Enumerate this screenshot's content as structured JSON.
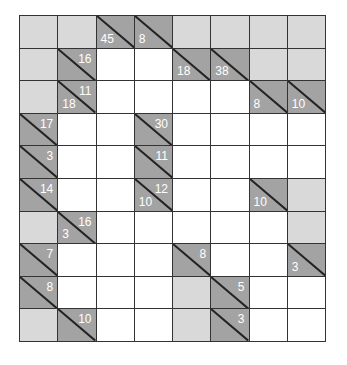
{
  "puzzle": {
    "type": "kakuro",
    "rows": 10,
    "cols": 8,
    "colors": {
      "blocked": "#d9d9d9",
      "clue": "#a3a3a3",
      "empty": "#ffffff",
      "grid_line": "#333333",
      "clue_text": "#ffffff"
    },
    "cells": [
      [
        {
          "t": "L"
        },
        {
          "t": "L"
        },
        {
          "t": "D",
          "down": "45"
        },
        {
          "t": "D",
          "down": "8"
        },
        {
          "t": "L"
        },
        {
          "t": "L"
        },
        {
          "t": "L"
        },
        {
          "t": "L"
        }
      ],
      [
        {
          "t": "L"
        },
        {
          "t": "D",
          "right": "16"
        },
        {
          "t": "W"
        },
        {
          "t": "W"
        },
        {
          "t": "D",
          "down": "18"
        },
        {
          "t": "D",
          "down": "38"
        },
        {
          "t": "L"
        },
        {
          "t": "L"
        }
      ],
      [
        {
          "t": "L"
        },
        {
          "t": "D",
          "down": "18",
          "right": "11"
        },
        {
          "t": "W"
        },
        {
          "t": "W"
        },
        {
          "t": "W"
        },
        {
          "t": "W"
        },
        {
          "t": "D",
          "down": "8"
        },
        {
          "t": "D",
          "down": "10"
        }
      ],
      [
        {
          "t": "D",
          "right": "17"
        },
        {
          "t": "W"
        },
        {
          "t": "W"
        },
        {
          "t": "D",
          "right": "30"
        },
        {
          "t": "W"
        },
        {
          "t": "W"
        },
        {
          "t": "W"
        },
        {
          "t": "W"
        }
      ],
      [
        {
          "t": "D",
          "right": "3"
        },
        {
          "t": "W"
        },
        {
          "t": "W"
        },
        {
          "t": "D",
          "right": "11"
        },
        {
          "t": "W"
        },
        {
          "t": "W"
        },
        {
          "t": "W"
        },
        {
          "t": "W"
        }
      ],
      [
        {
          "t": "D",
          "right": "14"
        },
        {
          "t": "W"
        },
        {
          "t": "W"
        },
        {
          "t": "D",
          "down": "10",
          "right": "12"
        },
        {
          "t": "W"
        },
        {
          "t": "W"
        },
        {
          "t": "D",
          "down": "10"
        },
        {
          "t": "L"
        }
      ],
      [
        {
          "t": "L"
        },
        {
          "t": "D",
          "down": "3",
          "right": "16"
        },
        {
          "t": "W"
        },
        {
          "t": "W"
        },
        {
          "t": "W"
        },
        {
          "t": "W"
        },
        {
          "t": "W"
        },
        {
          "t": "L"
        }
      ],
      [
        {
          "t": "D",
          "right": "7"
        },
        {
          "t": "W"
        },
        {
          "t": "W"
        },
        {
          "t": "W"
        },
        {
          "t": "D",
          "right": "8"
        },
        {
          "t": "W"
        },
        {
          "t": "W"
        },
        {
          "t": "D",
          "down": "3"
        }
      ],
      [
        {
          "t": "D",
          "right": "8"
        },
        {
          "t": "W"
        },
        {
          "t": "W"
        },
        {
          "t": "W"
        },
        {
          "t": "L"
        },
        {
          "t": "D",
          "right": "5"
        },
        {
          "t": "W"
        },
        {
          "t": "W"
        }
      ],
      [
        {
          "t": "L"
        },
        {
          "t": "D",
          "right": "10"
        },
        {
          "t": "W"
        },
        {
          "t": "W"
        },
        {
          "t": "L"
        },
        {
          "t": "D",
          "right": "3"
        },
        {
          "t": "W"
        },
        {
          "t": "W"
        }
      ]
    ]
  }
}
